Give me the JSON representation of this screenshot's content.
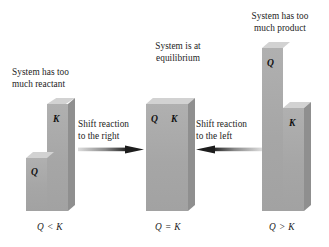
{
  "figure": {
    "type": "diagram",
    "background_color": "#ffffff",
    "block_front_color": "#a9a9a9",
    "block_top_color": "#d2d2d2",
    "block_side_color": "#8f8f8f",
    "text_color": "#1c1c1c"
  },
  "panels": [
    {
      "id": "left",
      "caption": "System has too\nmuch reactant",
      "relation": "Q < K",
      "bars": [
        {
          "label": "Q",
          "height_rel": 0.5
        },
        {
          "label": "K",
          "height_rel": 1.0
        }
      ]
    },
    {
      "id": "middle",
      "caption": "System is at\nequilibrium",
      "relation": "Q = K",
      "bars": [
        {
          "label": "Q",
          "height_rel": 1.0
        },
        {
          "label": "K",
          "height_rel": 1.0
        }
      ]
    },
    {
      "id": "right",
      "caption": "System has too\nmuch product",
      "relation": "Q > K",
      "bars": [
        {
          "label": "Q",
          "height_rel": 1.0
        },
        {
          "label": "K",
          "height_rel": 0.63
        }
      ]
    }
  ],
  "arrows": [
    {
      "id": "shift-right",
      "label": "Shift reaction\nto the right",
      "direction": "right"
    },
    {
      "id": "shift-left",
      "label": "Shift reaction\nto the left",
      "direction": "left"
    }
  ]
}
